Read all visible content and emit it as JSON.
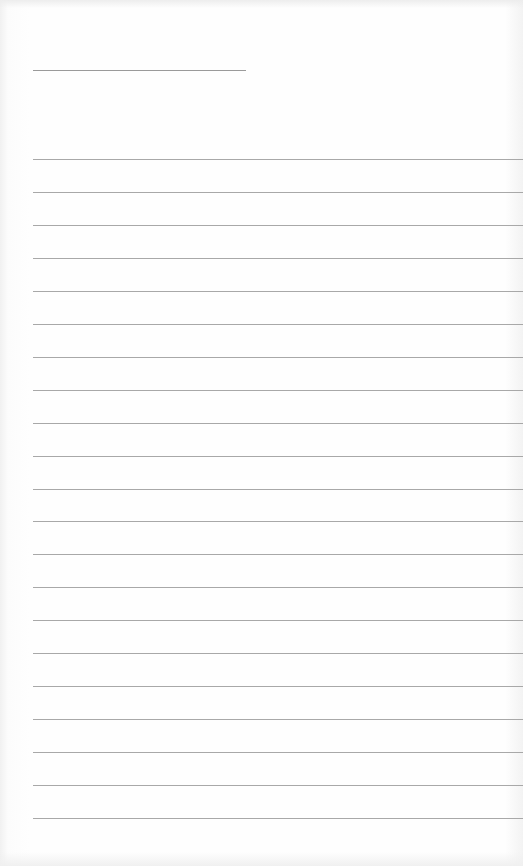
{
  "document": {
    "type": "blank-lined-paper",
    "title_line": {
      "x": 33,
      "y": 70,
      "width": 213
    },
    "rules": {
      "count": 21,
      "first_y": 159,
      "spacing": 32.95,
      "left": 33
    },
    "colors": {
      "paper": "#fefefe",
      "rule": "#a8a8a8",
      "title_line": "#9a9a9a"
    }
  }
}
